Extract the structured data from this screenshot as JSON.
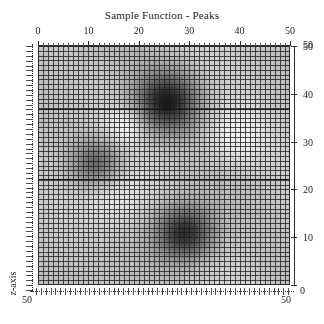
{
  "chart_data": {
    "type": "heatmap",
    "title": "Sample Function - Peaks",
    "subtitle": "",
    "render_style": "grayscale surface mesh viewed from above",
    "colormap": "gray",
    "grid": true,
    "mesh_cells_x": 50,
    "mesh_cells_y": 50,
    "xlabel": "",
    "ylabel": "",
    "zlabel": "z-axis",
    "xlim": [
      0,
      50
    ],
    "ylim": [
      0,
      50
    ],
    "x_axis_position": "top",
    "y_axis_position": "right",
    "z_axis_position": "left",
    "xticks": [
      0,
      10,
      20,
      30,
      40,
      50
    ],
    "xticklabels": [
      "0",
      "10",
      "20",
      "30",
      "40",
      "50"
    ],
    "yticks": [
      0,
      10,
      20,
      30,
      40,
      50
    ],
    "yticklabels": [
      "0",
      "10",
      "20",
      "30",
      "40",
      "50"
    ],
    "bottom_axis_end_label": "50",
    "legend": null,
    "peaks": [
      {
        "name": "peak-upper",
        "x": 25.4,
        "y": 38.5,
        "amplitude": 1.0,
        "sigma": 6.0,
        "polarity": "dark"
      },
      {
        "name": "peak-lower",
        "x": 29.0,
        "y": 11.0,
        "amplitude": 0.95,
        "sigma": 5.6,
        "polarity": "dark"
      },
      {
        "name": "peak-left",
        "x": 11.5,
        "y": 25.5,
        "amplitude": 0.62,
        "sigma": 5.0,
        "polarity": "dark"
      },
      {
        "name": "valley-right-upper",
        "x": 39.0,
        "y": 31.0,
        "amplitude": -0.3,
        "sigma": 6.5,
        "polarity": "light"
      },
      {
        "name": "valley-lower-left",
        "x": 15.0,
        "y": 19.0,
        "amplitude": -0.22,
        "sigma": 7.0,
        "polarity": "light"
      },
      {
        "name": "valley-upper-left",
        "x": 17.5,
        "y": 33.5,
        "amplitude": -0.28,
        "sigma": 4.0,
        "polarity": "light"
      }
    ],
    "colors": {
      "background": "#ffffff",
      "axis": "#2b2b2b",
      "mesh": "#2f2f2f",
      "text": "#1c1c1c",
      "surface_low": "#f2f2f2",
      "surface_mid": "#9a9a9a",
      "surface_high": "#1d1d1d"
    }
  }
}
